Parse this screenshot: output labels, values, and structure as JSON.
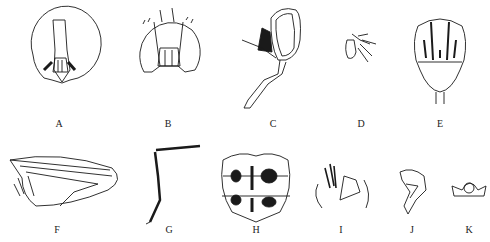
{
  "figure": {
    "panels": [
      {
        "id": "A",
        "label": "A",
        "subject": "head, frontal view",
        "x": 59,
        "y": 124
      },
      {
        "id": "B",
        "label": "B",
        "subject": "head, frontal view (alternate)",
        "x": 168,
        "y": 124
      },
      {
        "id": "C",
        "label": "C",
        "subject": "head and proboscis, lateral view",
        "x": 273,
        "y": 124
      },
      {
        "id": "D",
        "label": "D",
        "subject": "antenna with arista",
        "x": 361,
        "y": 124
      },
      {
        "id": "E",
        "label": "E",
        "subject": "thorax, dorsal view with vittae",
        "x": 440,
        "y": 124
      },
      {
        "id": "F",
        "label": "F",
        "subject": "wing",
        "x": 57,
        "y": 230
      },
      {
        "id": "G",
        "label": "G",
        "subject": "leg with setae",
        "x": 169,
        "y": 230
      },
      {
        "id": "H",
        "label": "H",
        "subject": "abdomen, dorsal view with dark spots",
        "x": 256,
        "y": 230
      },
      {
        "id": "I",
        "label": "I",
        "subject": "male terminalia",
        "x": 341,
        "y": 230
      },
      {
        "id": "J",
        "label": "J",
        "subject": "aedeagus, lateral view",
        "x": 412,
        "y": 230
      },
      {
        "id": "K",
        "label": "K",
        "subject": "sternite",
        "x": 469,
        "y": 230
      }
    ]
  },
  "colors": {
    "line": "#1a1a1a",
    "background": "#ffffff"
  }
}
